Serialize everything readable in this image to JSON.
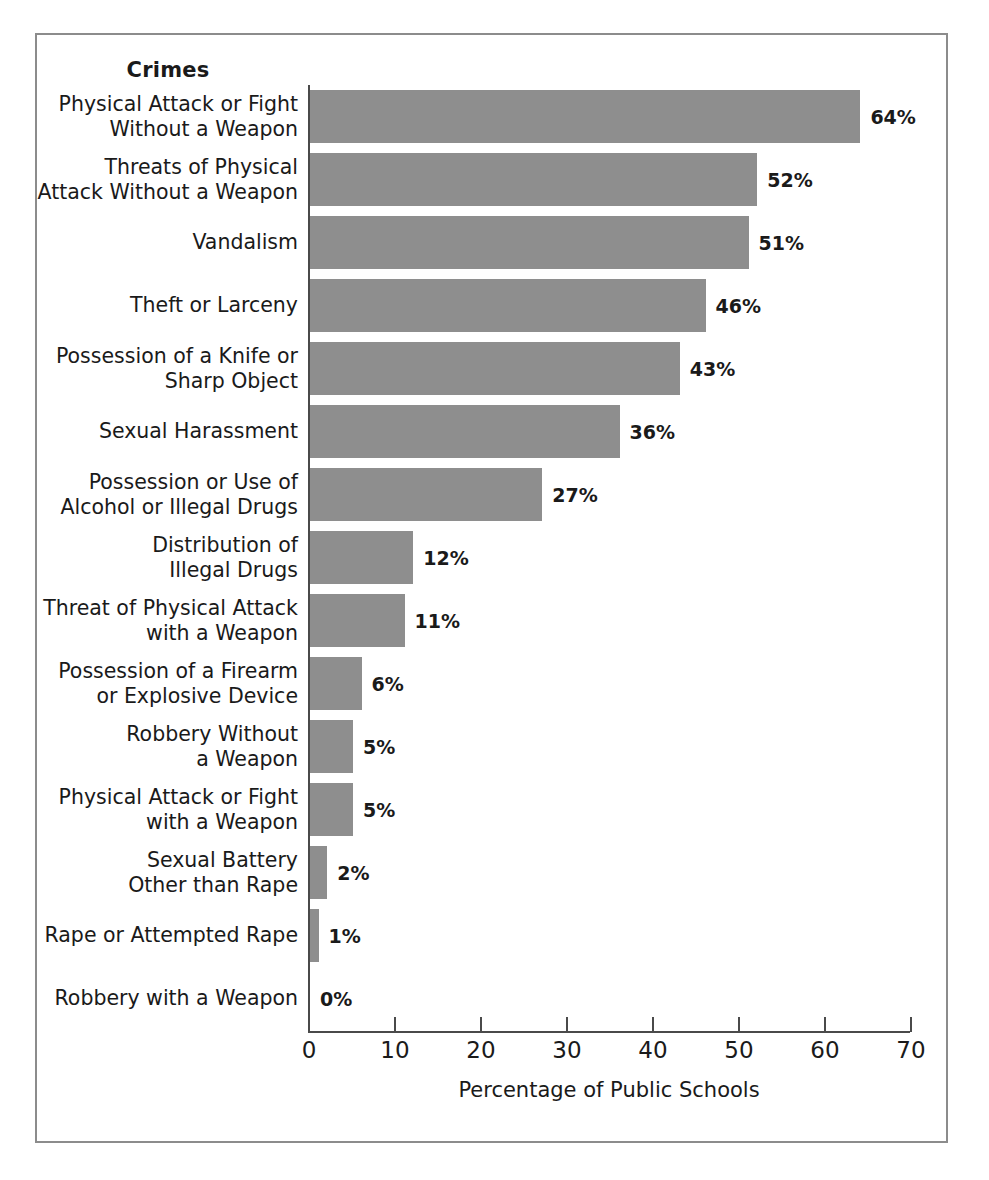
{
  "figure": {
    "header_label": "Crimes",
    "bar_color": "#8e8e8e",
    "axis_color": "#4a4a4a",
    "frame_color": "#8c8c8c"
  },
  "chart_data": {
    "type": "bar",
    "orientation": "horizontal",
    "title": "Crimes",
    "xlabel": "Percentage of Public Schools",
    "ylabel": "Crimes",
    "xlim": [
      0,
      70
    ],
    "grid": false,
    "legend": null,
    "tick_labels": [
      "0",
      "10",
      "20",
      "30",
      "40",
      "50",
      "60",
      "70"
    ],
    "tick_values": [
      0,
      10,
      20,
      30,
      40,
      50,
      60,
      70
    ],
    "categories": [
      "Physical Attack or Fight Without a Weapon",
      "Threats of Physical Attack Without a Weapon",
      "Vandalism",
      "Theft or Larceny",
      "Possession of a Knife or Sharp Object",
      "Sexual Harassment",
      "Possession or Use of Alcohol or Illegal Drugs",
      "Distribution of Illegal Drugs",
      "Threat of Physical Attack with a Weapon",
      "Possession of a Firearm or Explosive Device",
      "Robbery Without a Weapon",
      "Physical Attack or Fight with a Weapon",
      "Sexual Battery Other than Rape",
      "Rape or Attempted Rape",
      "Robbery with a Weapon"
    ],
    "values": [
      64,
      52,
      51,
      46,
      43,
      36,
      27,
      12,
      11,
      6,
      5,
      5,
      2,
      1,
      0
    ],
    "data_labels": [
      "64%",
      "52%",
      "51%",
      "46%",
      "43%",
      "36%",
      "27%",
      "12%",
      "11%",
      "6%",
      "5%",
      "5%",
      "2%",
      "1%",
      "0%"
    ]
  },
  "rows": [
    {
      "lines": [
        "Physical Attack or Fight",
        "Without a Weapon"
      ],
      "value": 64,
      "label": "64%"
    },
    {
      "lines": [
        "Threats of Physical",
        "Attack Without a Weapon"
      ],
      "value": 52,
      "label": "52%"
    },
    {
      "lines": [
        "Vandalism"
      ],
      "value": 51,
      "label": "51%"
    },
    {
      "lines": [
        "Theft or Larceny"
      ],
      "value": 46,
      "label": "46%"
    },
    {
      "lines": [
        "Possession of a Knife or",
        "Sharp Object"
      ],
      "value": 43,
      "label": "43%"
    },
    {
      "lines": [
        "Sexual Harassment"
      ],
      "value": 36,
      "label": "36%"
    },
    {
      "lines": [
        "Possession or Use of",
        "Alcohol or Illegal Drugs"
      ],
      "value": 27,
      "label": "27%"
    },
    {
      "lines": [
        "Distribution of",
        "Illegal Drugs"
      ],
      "value": 12,
      "label": "12%"
    },
    {
      "lines": [
        "Threat of Physical Attack",
        "with a Weapon"
      ],
      "value": 11,
      "label": "11%"
    },
    {
      "lines": [
        "Possession of a Firearm",
        "or Explosive Device"
      ],
      "value": 6,
      "label": "6%"
    },
    {
      "lines": [
        "Robbery Without",
        "a Weapon"
      ],
      "value": 5,
      "label": "5%"
    },
    {
      "lines": [
        "Physical Attack or Fight",
        "with a Weapon"
      ],
      "value": 5,
      "label": "5%"
    },
    {
      "lines": [
        "Sexual Battery",
        "Other than Rape"
      ],
      "value": 2,
      "label": "2%"
    },
    {
      "lines": [
        "Rape or Attempted Rape"
      ],
      "value": 1,
      "label": "1%"
    },
    {
      "lines": [
        "Robbery with a Weapon"
      ],
      "value": 0,
      "label": "0%"
    }
  ],
  "axis": {
    "title": "Percentage of Public Schools",
    "ticks": [
      "0",
      "10",
      "20",
      "30",
      "40",
      "50",
      "60",
      "70"
    ]
  }
}
